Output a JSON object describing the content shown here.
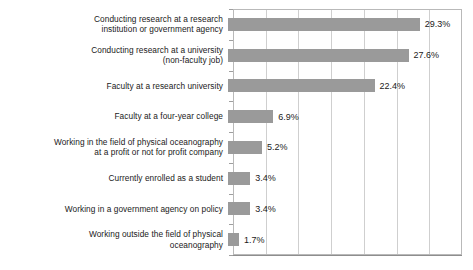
{
  "chart_data": {
    "type": "bar",
    "orientation": "horizontal",
    "title": "",
    "xlabel": "",
    "ylabel": "",
    "xlim": [
      0,
      35
    ],
    "grid": true,
    "gridline_step": 5,
    "legend": "none",
    "bar_color": "#9a9a9a",
    "categories": [
      "Conducting research at a research institution or government agency",
      "Conducting research at a university (non-faculty job)",
      "Faculty at a research university",
      "Faculty at a four-year college",
      "Working in the field of physical oceanography at a profit or not for profit company",
      "Currently enrolled as a student",
      "Working in a government agency on policy",
      "Working outside the field of physical oceanography"
    ],
    "category_lines": [
      [
        "Conducting research at a research",
        "institution or government agency"
      ],
      [
        "Conducting research at a university",
        "(non-faculty job)"
      ],
      [
        "Faculty at a research university"
      ],
      [
        "Faculty at a four-year college"
      ],
      [
        "Working in the field of physical oceanography",
        "at a profit or not for profit company"
      ],
      [
        "Currently enrolled as a student"
      ],
      [
        "Working in a government agency on policy"
      ],
      [
        "Working outside the field of physical",
        "oceanography"
      ]
    ],
    "values": [
      29.3,
      27.6,
      22.4,
      6.9,
      5.2,
      3.4,
      3.4,
      1.7
    ],
    "value_labels": [
      "29.3%",
      "27.6%",
      "22.4%",
      "6.9%",
      "5.2%",
      "3.4%",
      "3.4%",
      "1.7%"
    ]
  },
  "axis": {
    "gridline_values": [
      5,
      10,
      15,
      20,
      25,
      30
    ]
  }
}
